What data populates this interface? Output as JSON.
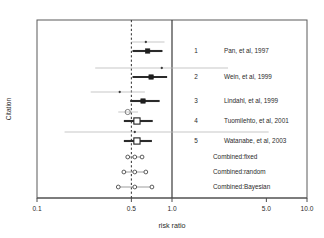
{
  "chart_data": {
    "type": "scatter",
    "subtype": "forest-plot",
    "title": "",
    "xlabel": "risk ratio",
    "ylabel": "Citation",
    "xscale": "log",
    "xlim": [
      0.1,
      10.0
    ],
    "xticks": [
      0.1,
      0.5,
      1.0,
      5.0,
      10.0
    ],
    "xtick_labels": [
      "0.1",
      "0.5",
      "1.0",
      "5.0",
      "10.0"
    ],
    "grid": false,
    "legend": "none",
    "reference_lines": [
      {
        "x": 1.0,
        "style": "solid",
        "label": "null effect"
      },
      {
        "x": 0.5,
        "style": "dashed",
        "label": "combined estimate"
      }
    ],
    "series": [
      {
        "name": "Observed estimate",
        "marker": "small-dot",
        "line": "thin-gray"
      },
      {
        "name": "Shrunken estimate",
        "marker": "square",
        "line": "thick-black"
      },
      {
        "name": "Combined estimate",
        "marker": "open-circle",
        "line": "gray"
      }
    ],
    "studies": [
      {
        "number": "1",
        "citation": "Pan, et al, 1997",
        "observed": {
          "estimate": 0.64,
          "lower": 0.5,
          "upper": 0.88,
          "marker": "dot"
        },
        "shrunken": {
          "estimate": 0.66,
          "lower": 0.51,
          "upper": 0.85,
          "marker": "filled-square"
        }
      },
      {
        "number": "2",
        "citation": "Wein, et al, 1999",
        "observed": {
          "estimate": 0.84,
          "lower": 0.27,
          "upper": 2.6,
          "marker": "dot"
        },
        "shrunken": {
          "estimate": 0.7,
          "lower": 0.51,
          "upper": 0.92,
          "marker": "filled-square"
        }
      },
      {
        "number": "3",
        "citation": "Lindahl, et al, 1999",
        "observed": {
          "estimate": 0.41,
          "lower": 0.25,
          "upper": 0.63,
          "marker": "dot"
        },
        "shrunken": {
          "estimate": 0.61,
          "lower": 0.49,
          "upper": 0.81,
          "marker": "filled-square"
        }
      },
      {
        "number": "4",
        "citation": "Tuomilehto, et al, 2001",
        "observed": {
          "estimate": 0.47,
          "lower": 0.4,
          "upper": 0.56,
          "marker": "open-circle"
        },
        "shrunken": {
          "estimate": 0.55,
          "lower": 0.44,
          "upper": 0.72,
          "marker": "open-square"
        }
      },
      {
        "number": "5",
        "citation": "Watanabe, et al, 2003",
        "observed": {
          "estimate": 0.53,
          "lower": 0.16,
          "upper": 5.2,
          "marker": "dot"
        },
        "shrunken": {
          "estimate": 0.55,
          "lower": 0.44,
          "upper": 0.71,
          "marker": "open-square"
        }
      }
    ],
    "combined": [
      {
        "label": "Combined:fixed",
        "estimate": 0.53,
        "lower": 0.47,
        "upper": 0.6
      },
      {
        "label": "Combined:random",
        "estimate": 0.53,
        "lower": 0.44,
        "upper": 0.64
      },
      {
        "label": "Combined:Bayesian",
        "estimate": 0.53,
        "lower": 0.4,
        "upper": 0.71
      }
    ]
  }
}
